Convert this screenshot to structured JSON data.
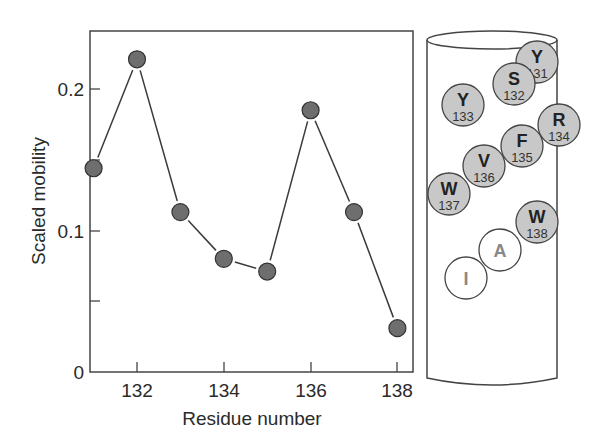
{
  "chart_data": {
    "type": "line",
    "title": "",
    "xlabel": "Residue number",
    "ylabel": "Scaled mobility",
    "x": [
      131,
      132,
      133,
      134,
      135,
      136,
      137,
      138
    ],
    "series": [
      {
        "name": "Scaled mobility",
        "values": [
          0.144,
          0.221,
          0.113,
          0.08,
          0.071,
          0.185,
          0.113,
          0.031
        ]
      }
    ],
    "xticks": [
      "132",
      "134",
      "136",
      "138"
    ],
    "yticks": [
      "0",
      "0.1",
      "0.2"
    ],
    "yminor_ticks": [
      0.05,
      0.15
    ],
    "xlim": [
      131,
      138.3
    ],
    "ylim": [
      0,
      0.24
    ],
    "grid": false,
    "legend": "none",
    "marker_color": "#6e6e6e",
    "line_color": "#3a3a3a"
  },
  "helix_diagram": {
    "residues": [
      {
        "letter": "Y",
        "number": "131",
        "shaded": true
      },
      {
        "letter": "S",
        "number": "132",
        "shaded": true
      },
      {
        "letter": "Y",
        "number": "133",
        "shaded": true
      },
      {
        "letter": "R",
        "number": "134",
        "shaded": true
      },
      {
        "letter": "F",
        "number": "135",
        "shaded": true
      },
      {
        "letter": "V",
        "number": "136",
        "shaded": true
      },
      {
        "letter": "W",
        "number": "137",
        "shaded": true
      },
      {
        "letter": "W",
        "number": "138",
        "shaded": true
      },
      {
        "letter": "A",
        "number": "",
        "shaded": false
      },
      {
        "letter": "I",
        "number": "",
        "shaded": false
      }
    ],
    "shaded_fill": "#c8c8c8",
    "unshaded_fill": "#ffffff"
  }
}
